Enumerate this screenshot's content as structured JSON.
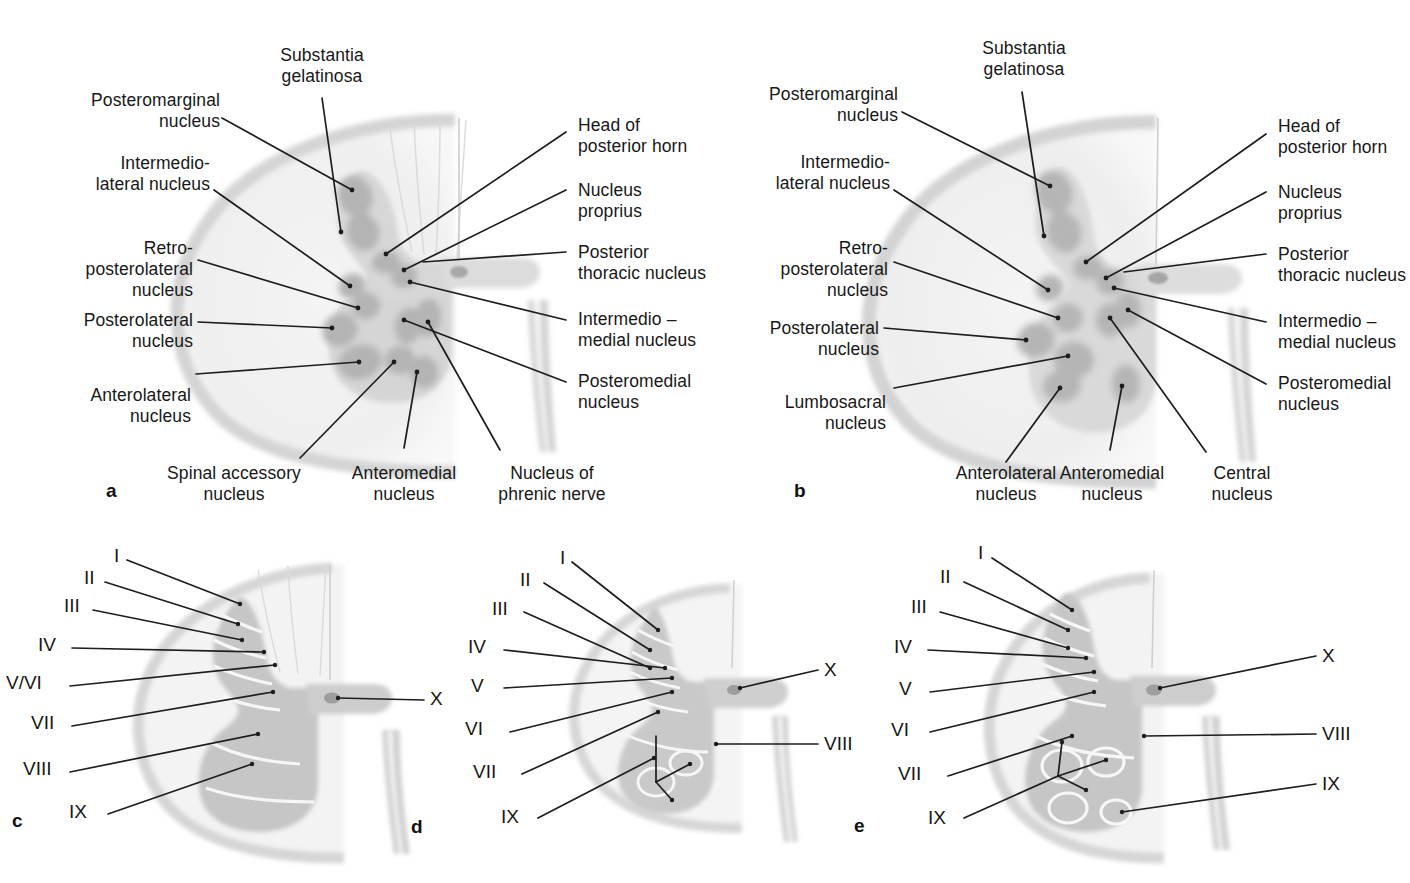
{
  "figure": {
    "background_color": "#ffffff",
    "line_color": "#1d1d1d",
    "gray_matter_color": "#d9d9d9",
    "nucleus_color": "#b8b8b8",
    "white_matter_color": "#efefef"
  },
  "panels": [
    {
      "id": "a",
      "letter": "a",
      "labels_left": [
        {
          "text": "Posteromarginal\nnucleus"
        },
        {
          "text": "Intermedio-\nlateral nucleus"
        },
        {
          "text": "Retro-\nposterolateral\nnucleus"
        },
        {
          "text": "Posterolateral\nnucleus"
        },
        {
          "text": "Anterolateral\nnucleus"
        }
      ],
      "labels_top": [
        {
          "text": "Substantia\ngelatinosa"
        }
      ],
      "labels_right": [
        {
          "text": "Head of\nposterior horn"
        },
        {
          "text": "Nucleus\nproprius"
        },
        {
          "text": "Posterior\nthoracic nucleus"
        },
        {
          "text": "Intermedio –\nmedial nucleus"
        },
        {
          "text": "Posteromedial\nnucleus"
        }
      ],
      "labels_bottom": [
        {
          "text": "Spinal accessory\nnucleus"
        },
        {
          "text": "Anteromedial\nnucleus"
        },
        {
          "text": "Nucleus of\nphrenic nerve"
        }
      ]
    },
    {
      "id": "b",
      "letter": "b",
      "labels_left": [
        {
          "text": "Posteromarginal\nnucleus"
        },
        {
          "text": "Intermedio-\nlateral nucleus"
        },
        {
          "text": "Retro-\nposterolateral\nnucleus"
        },
        {
          "text": "Posterolateral\nnucleus"
        },
        {
          "text": "Lumbosacral\nnucleus"
        }
      ],
      "labels_top": [
        {
          "text": "Substantia\ngelatinosa"
        }
      ],
      "labels_right": [
        {
          "text": "Head of\nposterior horn"
        },
        {
          "text": "Nucleus\nproprius"
        },
        {
          "text": "Posterior\nthoracic nucleus"
        },
        {
          "text": "Intermedio –\nmedial nucleus"
        },
        {
          "text": "Posteromedial\nnucleus"
        }
      ],
      "labels_bottom": [
        {
          "text": "Anterolateral\nnucleus"
        },
        {
          "text": "Anteromedial\nnucleus"
        },
        {
          "text": "Central\nnucleus"
        }
      ]
    },
    {
      "id": "c",
      "letter": "c",
      "laminae_left": [
        "I",
        "II",
        "III",
        "IV",
        "V/VI",
        "VII",
        "VIII",
        "IX"
      ],
      "laminae_right": [
        "X"
      ]
    },
    {
      "id": "d",
      "letter": "d",
      "laminae_left": [
        "I",
        "II",
        "III",
        "IV",
        "V",
        "VI",
        "VII",
        "IX"
      ],
      "laminae_right": [
        "X",
        "VIII"
      ]
    },
    {
      "id": "e",
      "letter": "e",
      "laminae_left": [
        "I",
        "II",
        "III",
        "IV",
        "V",
        "VI",
        "VII",
        "IX"
      ],
      "laminae_right": [
        "X",
        "VIII",
        "IX"
      ]
    }
  ]
}
